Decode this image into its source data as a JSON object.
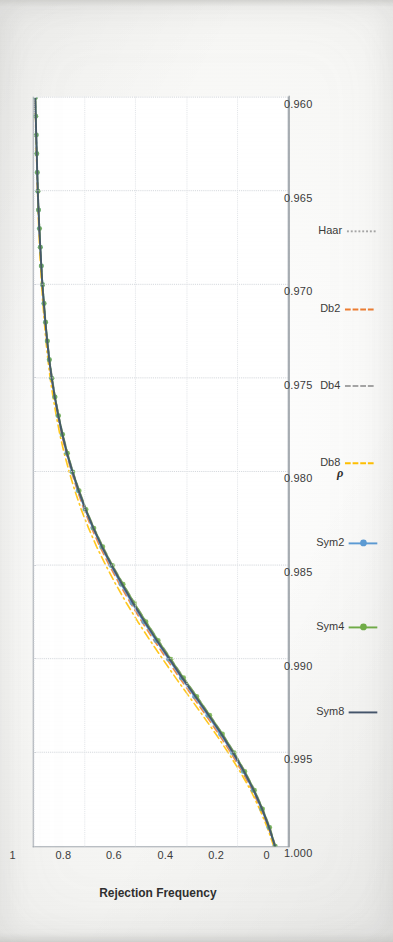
{
  "figure": {
    "rotation_note": "page-rotated-90",
    "plot_background": "#ffffff",
    "frame_color": "#9aa0a8"
  },
  "chart_data": {
    "type": "line",
    "title": "",
    "subtitle": "",
    "xlabel": "ρ",
    "ylabel": "Rejection Frequency",
    "xlim": [
      1.0,
      0.96
    ],
    "ylim": [
      0,
      1
    ],
    "x_ticks": [
      "1.000",
      "0.995",
      "0.990",
      "0.985",
      "0.980",
      "0.975",
      "0.970",
      "0.965",
      "0.960"
    ],
    "x_tick_values": [
      1.0,
      0.995,
      0.99,
      0.985,
      0.98,
      0.975,
      0.97,
      0.965,
      0.96
    ],
    "y_ticks": [
      "0",
      "0.2",
      "0.4",
      "0.6",
      "0.8",
      "1"
    ],
    "y_tick_values": [
      0,
      0.2,
      0.4,
      0.6,
      0.8,
      1
    ],
    "grid": true,
    "grid_color": "#cfd3d8",
    "legend_position": "bottom",
    "x": [
      1.0,
      0.999,
      0.998,
      0.997,
      0.996,
      0.995,
      0.994,
      0.993,
      0.992,
      0.991,
      0.99,
      0.989,
      0.988,
      0.987,
      0.986,
      0.985,
      0.984,
      0.983,
      0.982,
      0.981,
      0.98,
      0.979,
      0.978,
      0.977,
      0.976,
      0.975,
      0.974,
      0.973,
      0.972,
      0.971,
      0.97,
      0.969,
      0.968,
      0.967,
      0.966,
      0.965,
      0.964,
      0.963,
      0.962,
      0.961,
      0.96
    ],
    "series": [
      {
        "name": "Haar",
        "color": "#a6a6a6",
        "style": "dotted",
        "marker": "none",
        "values": [
          0.05,
          0.072,
          0.1,
          0.132,
          0.17,
          0.212,
          0.258,
          0.308,
          0.36,
          0.412,
          0.462,
          0.512,
          0.56,
          0.606,
          0.65,
          0.692,
          0.73,
          0.764,
          0.795,
          0.822,
          0.846,
          0.868,
          0.886,
          0.902,
          0.916,
          0.928,
          0.938,
          0.947,
          0.954,
          0.96,
          0.966,
          0.97,
          0.974,
          0.978,
          0.981,
          0.984,
          0.986,
          0.988,
          0.99,
          0.992,
          0.994
        ]
      },
      {
        "name": "Db2",
        "color": "#ed7d31",
        "style": "dashed",
        "marker": "none",
        "values": [
          0.052,
          0.076,
          0.106,
          0.14,
          0.18,
          0.224,
          0.272,
          0.322,
          0.374,
          0.426,
          0.476,
          0.526,
          0.574,
          0.619,
          0.662,
          0.702,
          0.739,
          0.772,
          0.802,
          0.828,
          0.851,
          0.872,
          0.89,
          0.905,
          0.918,
          0.93,
          0.94,
          0.948,
          0.955,
          0.961,
          0.966,
          0.971,
          0.975,
          0.978,
          0.981,
          0.984,
          0.987,
          0.989,
          0.991,
          0.993,
          0.994
        ]
      },
      {
        "name": "Db4",
        "color": "#a5a5a5",
        "style": "dashed",
        "marker": "none",
        "values": [
          0.048,
          0.07,
          0.098,
          0.13,
          0.168,
          0.21,
          0.256,
          0.306,
          0.357,
          0.409,
          0.459,
          0.509,
          0.557,
          0.603,
          0.647,
          0.689,
          0.727,
          0.762,
          0.793,
          0.82,
          0.845,
          0.866,
          0.885,
          0.901,
          0.915,
          0.927,
          0.937,
          0.946,
          0.953,
          0.959,
          0.965,
          0.97,
          0.974,
          0.977,
          0.981,
          0.983,
          0.986,
          0.988,
          0.99,
          0.992,
          0.993
        ]
      },
      {
        "name": "Db8",
        "color": "#ffc000",
        "style": "dashdot",
        "marker": "none",
        "values": [
          0.055,
          0.08,
          0.111,
          0.146,
          0.188,
          0.234,
          0.283,
          0.335,
          0.388,
          0.441,
          0.492,
          0.542,
          0.59,
          0.635,
          0.677,
          0.716,
          0.752,
          0.784,
          0.813,
          0.838,
          0.86,
          0.88,
          0.897,
          0.911,
          0.924,
          0.935,
          0.944,
          0.952,
          0.958,
          0.964,
          0.969,
          0.973,
          0.977,
          0.98,
          0.983,
          0.985,
          0.987,
          0.989,
          0.991,
          0.993,
          0.994
        ]
      },
      {
        "name": "Sym2",
        "color": "#5b9bd5",
        "style": "solid",
        "marker": "circle",
        "values": [
          0.051,
          0.074,
          0.103,
          0.136,
          0.175,
          0.218,
          0.265,
          0.315,
          0.367,
          0.419,
          0.469,
          0.519,
          0.567,
          0.613,
          0.656,
          0.696,
          0.733,
          0.767,
          0.798,
          0.825,
          0.849,
          0.87,
          0.888,
          0.904,
          0.917,
          0.929,
          0.939,
          0.947,
          0.954,
          0.96,
          0.965,
          0.97,
          0.974,
          0.978,
          0.981,
          0.984,
          0.986,
          0.988,
          0.99,
          0.992,
          0.994
        ]
      },
      {
        "name": "Sym4",
        "color": "#70ad47",
        "style": "solid",
        "marker": "circle",
        "values": [
          0.049,
          0.071,
          0.099,
          0.131,
          0.169,
          0.211,
          0.257,
          0.307,
          0.358,
          0.41,
          0.46,
          0.51,
          0.558,
          0.604,
          0.648,
          0.69,
          0.728,
          0.763,
          0.794,
          0.821,
          0.846,
          0.867,
          0.886,
          0.902,
          0.916,
          0.928,
          0.938,
          0.946,
          0.953,
          0.959,
          0.965,
          0.97,
          0.974,
          0.977,
          0.981,
          0.983,
          0.986,
          0.988,
          0.99,
          0.992,
          0.993
        ]
      },
      {
        "name": "Sym8",
        "color": "#44546a",
        "style": "solid",
        "marker": "none",
        "values": [
          0.05,
          0.073,
          0.101,
          0.134,
          0.172,
          0.215,
          0.261,
          0.311,
          0.363,
          0.415,
          0.465,
          0.515,
          0.563,
          0.609,
          0.652,
          0.693,
          0.731,
          0.765,
          0.796,
          0.823,
          0.847,
          0.869,
          0.887,
          0.903,
          0.917,
          0.929,
          0.939,
          0.947,
          0.954,
          0.96,
          0.966,
          0.97,
          0.974,
          0.978,
          0.981,
          0.984,
          0.986,
          0.988,
          0.99,
          0.992,
          0.994
        ]
      }
    ]
  }
}
